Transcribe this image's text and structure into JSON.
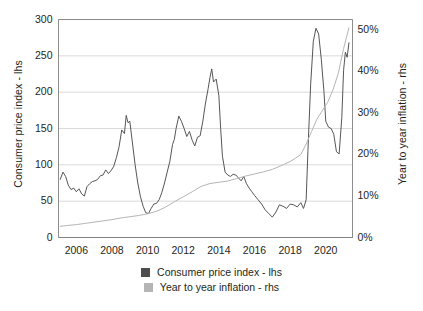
{
  "chart_data": {
    "type": "line",
    "title": "",
    "subtitle": "",
    "xlabel": "",
    "ylabel": "Consumer price index - lhs",
    "y2label": "Year to year inflation - rhs",
    "grid": true,
    "legend_position": "bottom-center",
    "xlim": [
      2005.0,
      2021.5
    ],
    "xticks": [
      2006,
      2008,
      2010,
      2012,
      2014,
      2016,
      2018,
      2020
    ],
    "xticklabels": [
      "2006",
      "2008",
      "2010",
      "2012",
      "2014",
      "2016",
      "2018",
      "2020"
    ],
    "ylim": [
      0,
      300
    ],
    "yticks": [
      0,
      50,
      100,
      150,
      200,
      250,
      300
    ],
    "yticklabels": [
      "0",
      "50",
      "100",
      "150",
      "200",
      "250",
      "300"
    ],
    "y2lim": [
      0,
      52.5
    ],
    "y2ticks": [
      0,
      10,
      20,
      30,
      40,
      50
    ],
    "y2ticklabels": [
      "0%",
      "10%",
      "20%",
      "30%",
      "40%",
      "50%"
    ],
    "colors": {
      "consumer_price_index": "#4d4d4d",
      "year_to_year_inflation": "#b5b5b5",
      "grid": "#c8c8c8",
      "axis": "#808080",
      "text": "#231f20"
    },
    "series": [
      {
        "name": "Consumer price index - lhs",
        "axis": "left",
        "color": "#4d4d4d",
        "x": [
          2005.1,
          2005.25,
          2005.4,
          2005.55,
          2005.7,
          2005.85,
          2006.0,
          2006.15,
          2006.3,
          2006.45,
          2006.6,
          2006.75,
          2006.9,
          2007.05,
          2007.2,
          2007.35,
          2007.5,
          2007.65,
          2007.8,
          2007.95,
          2008.1,
          2008.25,
          2008.4,
          2008.55,
          2008.7,
          2008.8,
          2008.9,
          2009.0,
          2009.15,
          2009.3,
          2009.45,
          2009.6,
          2009.75,
          2009.9,
          2010.05,
          2010.2,
          2010.35,
          2010.5,
          2010.65,
          2010.8,
          2010.95,
          2011.1,
          2011.25,
          2011.4,
          2011.5,
          2011.6,
          2011.75,
          2011.9,
          2012.05,
          2012.2,
          2012.35,
          2012.5,
          2012.65,
          2012.8,
          2012.95,
          2013.1,
          2013.25,
          2013.4,
          2013.5,
          2013.6,
          2013.7,
          2013.85,
          2014.0,
          2014.1,
          2014.2,
          2014.35,
          2014.5,
          2014.65,
          2014.8,
          2014.95,
          2015.1,
          2015.25,
          2015.4,
          2015.55,
          2015.7,
          2015.85,
          2016.0,
          2016.2,
          2016.4,
          2016.6,
          2016.8,
          2017.0,
          2017.2,
          2017.4,
          2017.6,
          2017.8,
          2018.0,
          2018.2,
          2018.4,
          2018.6,
          2018.75,
          2018.9,
          2019.0,
          2019.15,
          2019.3,
          2019.45,
          2019.6,
          2019.75,
          2019.9,
          2020.0,
          2020.15,
          2020.3,
          2020.45,
          2020.6,
          2020.75,
          2020.9,
          2021.0,
          2021.1,
          2021.2,
          2021.3
        ],
        "y": [
          80,
          90,
          84,
          72,
          66,
          68,
          63,
          67,
          60,
          57,
          70,
          74,
          77,
          78,
          80,
          85,
          86,
          93,
          88,
          92,
          98,
          110,
          125,
          148,
          143,
          168,
          158,
          160,
          130,
          100,
          75,
          56,
          43,
          34,
          33,
          40,
          46,
          47,
          52,
          62,
          75,
          90,
          105,
          128,
          135,
          150,
          167,
          160,
          150,
          139,
          146,
          134,
          126,
          138,
          140,
          160,
          185,
          205,
          220,
          232,
          214,
          218,
          195,
          150,
          112,
          90,
          86,
          84,
          87,
          86,
          82,
          78,
          84,
          74,
          68,
          63,
          58,
          52,
          46,
          38,
          33,
          28,
          35,
          45,
          43,
          40,
          46,
          45,
          42,
          48,
          40,
          52,
          120,
          210,
          270,
          288,
          280,
          245,
          200,
          160,
          152,
          150,
          142,
          118,
          115,
          165,
          230,
          255,
          248,
          268
        ],
        "annotations": []
      },
      {
        "name": "Year to year inflation - rhs",
        "axis": "right",
        "color": "#b5b5b5",
        "x": [
          2005.1,
          2005.5,
          2006.0,
          2006.5,
          2007.0,
          2007.5,
          2008.0,
          2008.5,
          2009.0,
          2009.5,
          2010.0,
          2010.5,
          2011.0,
          2011.5,
          2012.0,
          2012.5,
          2013.0,
          2013.5,
          2014.0,
          2014.5,
          2015.0,
          2015.5,
          2016.0,
          2016.5,
          2017.0,
          2017.5,
          2018.0,
          2018.3,
          2018.6,
          2018.9,
          2019.2,
          2019.5,
          2019.8,
          2020.1,
          2020.4,
          2020.7,
          2021.0,
          2021.3
        ],
        "y": [
          2.7,
          2.9,
          3.1,
          3.4,
          3.7,
          4.0,
          4.3,
          4.7,
          5.0,
          5.3,
          5.7,
          6.3,
          7.3,
          8.6,
          9.8,
          11.0,
          12.3,
          13.0,
          13.3,
          13.6,
          14.2,
          14.8,
          15.3,
          15.8,
          16.4,
          17.3,
          18.3,
          19.1,
          20.0,
          22.5,
          25.5,
          28.5,
          30.5,
          32.5,
          35.5,
          39.5,
          45.5,
          50.5
        ],
        "annotations": []
      }
    ],
    "legend": [
      {
        "label": "Consumer price index - lhs",
        "color": "#4d4d4d"
      },
      {
        "label": "Year to year inflation - rhs",
        "color": "#b5b5b5"
      }
    ]
  }
}
